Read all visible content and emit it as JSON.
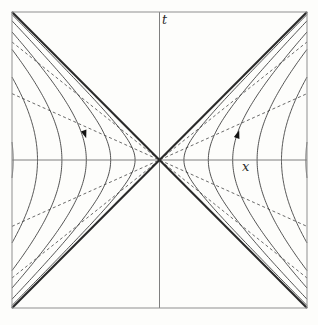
{
  "figure": {
    "canvas": {
      "width": 318,
      "height": 325,
      "background": "#fdfdfb"
    },
    "box": {
      "left": 12,
      "top": 12,
      "width": 295,
      "height": 296,
      "stroke": "#8f8f8f",
      "stroke_width": 1
    },
    "center": {
      "x": 159.5,
      "y": 160
    },
    "axes": {
      "color": "#7f7f7f",
      "stroke_width": 1,
      "t_label": {
        "text": "t",
        "left": 162,
        "top": 14
      },
      "x_label": {
        "text": "x",
        "left": 242,
        "top": 160
      }
    },
    "light_cone": {
      "color": "#2a2a2a",
      "stroke_width": 2.1
    },
    "hyperbolas": {
      "color": "#3f3f3f",
      "stroke_width": 0.9,
      "vertex_offsets": [
        24.4,
        48.8,
        73.2,
        97.6,
        122,
        146.4
      ],
      "wedges": [
        "right",
        "left"
      ]
    },
    "dashed_lines": {
      "color": "#4f4f4f",
      "stroke_width": 0.85,
      "dash": "3 2.6",
      "slopes": [
        0.45,
        0.8
      ]
    },
    "arrows": {
      "color": "#131313",
      "half_width": 2.9,
      "length": 8.2,
      "items": [
        {
          "name": "right-wedge-flow-arrow",
          "x": 237.8,
          "y": 134.5,
          "direction": "up",
          "rotation": 18
        },
        {
          "name": "left-wedge-flow-arrow",
          "x": 84.8,
          "y": 134.0,
          "direction": "down",
          "rotation": -18
        }
      ]
    }
  }
}
